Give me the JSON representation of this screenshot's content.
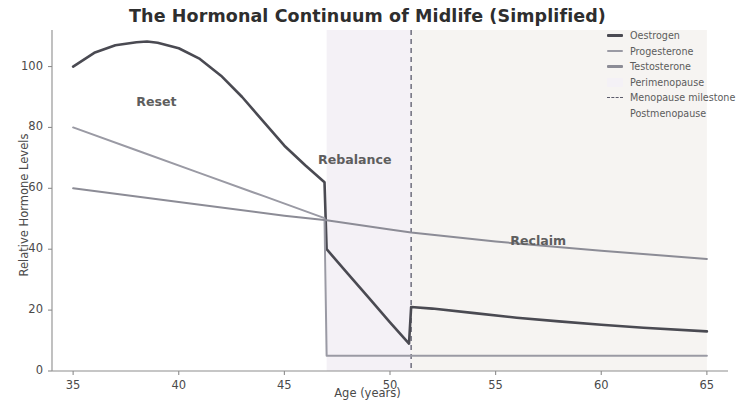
{
  "chart_data": {
    "type": "line",
    "title": "The Hormonal Continuum of Midlife (Simplified)",
    "xlabel": "Age (years)",
    "ylabel": "Relative Hormone Levels",
    "xlim": [
      34,
      66
    ],
    "ylim": [
      0,
      112
    ],
    "xticks": [
      35,
      40,
      45,
      50,
      55,
      60,
      65
    ],
    "yticks": [
      0,
      20,
      40,
      60,
      80,
      100
    ],
    "grid": false,
    "legend_position": "upper right",
    "series": [
      {
        "name": "Oestrogen",
        "color": "#4a4a52",
        "linestyle": "solid",
        "points": [
          [
            35,
            100
          ],
          [
            36,
            104.5
          ],
          [
            37,
            107
          ],
          [
            38,
            108
          ],
          [
            38.5,
            108.2
          ],
          [
            39,
            107.8
          ],
          [
            40,
            106
          ],
          [
            41,
            102.5
          ],
          [
            42,
            97
          ],
          [
            43,
            90
          ],
          [
            44,
            82
          ],
          [
            45,
            74
          ],
          [
            46,
            67.5
          ],
          [
            46.9,
            62
          ],
          [
            47,
            40
          ],
          [
            48,
            32
          ],
          [
            49,
            24
          ],
          [
            50,
            16
          ],
          [
            50.9,
            9
          ],
          [
            51,
            21
          ],
          [
            52,
            20.5
          ],
          [
            54,
            19
          ],
          [
            56,
            17.5
          ],
          [
            58,
            16.3
          ],
          [
            60,
            15.2
          ],
          [
            62,
            14.2
          ],
          [
            65,
            13
          ]
        ]
      },
      {
        "name": "Progesterone",
        "color": "#9a9aa4",
        "linestyle": "solid",
        "points": [
          [
            35,
            80
          ],
          [
            38,
            72.5
          ],
          [
            41,
            65
          ],
          [
            44,
            57.5
          ],
          [
            46.9,
            50.2
          ],
          [
            47,
            5
          ],
          [
            51,
            5
          ],
          [
            55,
            5
          ],
          [
            60,
            5
          ],
          [
            65,
            5
          ]
        ]
      },
      {
        "name": "Testosterone",
        "color": "#8c8c96",
        "linestyle": "solid",
        "points": [
          [
            35,
            60
          ],
          [
            40,
            55.5
          ],
          [
            45,
            51
          ],
          [
            47,
            49.5
          ],
          [
            50,
            46.5
          ],
          [
            51,
            45.5
          ],
          [
            55,
            42.5
          ],
          [
            60,
            39.5
          ],
          [
            65,
            36.8
          ]
        ]
      }
    ],
    "spans": [
      {
        "name": "Perimenopause",
        "x0": 47,
        "x1": 51,
        "color": "#f4f1f6"
      },
      {
        "name": "Postmenopause",
        "x0": 51,
        "x1": 65,
        "color": "#f6f4f2"
      }
    ],
    "vlines": [
      {
        "name": "Menopause milestone",
        "x": 51,
        "color": "#5a5a6a",
        "linestyle": "dashed"
      }
    ],
    "annotations": [
      {
        "text": "Reset",
        "x": 39.6,
        "y": 88
      },
      {
        "text": "Rebalance",
        "x": 48.2,
        "y": 69
      },
      {
        "text": "Reclaim",
        "x": 57.3,
        "y": 42.5
      }
    ],
    "legend_entries": [
      {
        "label": "Oestrogen",
        "swatch": "line",
        "color": "#4a4a52"
      },
      {
        "label": "Progesterone",
        "swatch": "line",
        "color": "#9a9aa4"
      },
      {
        "label": "Testosterone",
        "swatch": "line",
        "color": "#8c8c96"
      },
      {
        "label": "Perimenopause",
        "swatch": "patch",
        "color": "#f4f1f6"
      },
      {
        "label": "Menopause milestone",
        "swatch": "dashed-line",
        "color": "#5a5a6a"
      },
      {
        "label": "Postmenopause",
        "swatch": "patch",
        "color": "#f6f4f2"
      }
    ],
    "axis_color": "#8d8d8d",
    "background": "#ffffff"
  }
}
